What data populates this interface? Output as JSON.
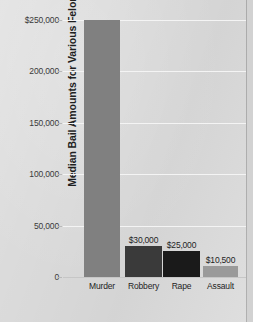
{
  "chart_data": {
    "type": "bar",
    "title": "",
    "xlabel": "",
    "ylabel": "Median Bail Amounts for Various Felonies",
    "categories": [
      "Murder",
      "Robbery",
      "Rape",
      "Assault"
    ],
    "values": [
      250000,
      30000,
      25000,
      10500
    ],
    "value_labels": [
      "",
      "$30,000",
      "$25,000",
      "$10,500"
    ],
    "bar_colors": [
      "#808080",
      "#3a3a3a",
      "#1a1a1a",
      "#9a9a9a"
    ],
    "ylim": [
      0,
      250000
    ],
    "ytick_values": [
      250000,
      200000,
      150000,
      100000,
      50000,
      0
    ],
    "ytick_labels": [
      "$250,000",
      "200,000",
      "150,000",
      "100,000",
      "50,000",
      "0"
    ],
    "grid": true,
    "legend": "none",
    "background_color": "#dbdbdb",
    "gridline_color": "#f4f4f4",
    "axis_color": "#c6c6c6"
  },
  "axis": {
    "y_title": "Median Bail Amounts for Various Felonies"
  }
}
